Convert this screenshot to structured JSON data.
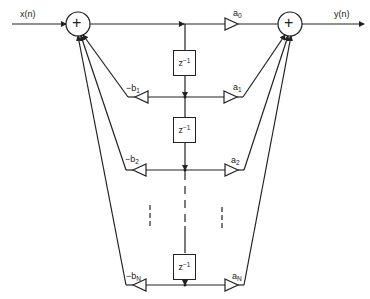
{
  "diagram": {
    "type": "IIR direct form II signal flow graph",
    "input_label": "x(n)",
    "output_label": "y(n)",
    "adders": [
      {
        "id": "left-adder",
        "symbol": "+"
      },
      {
        "id": "right-adder",
        "symbol": "+"
      }
    ],
    "delays": [
      {
        "label_base": "z",
        "label_exp": "−1"
      },
      {
        "label_base": "z",
        "label_exp": "−1"
      },
      {
        "label_base": "z",
        "label_exp": "−1"
      }
    ],
    "feedback_gains": [
      {
        "base": "−b",
        "sub": "1"
      },
      {
        "base": "−b",
        "sub": "2"
      },
      {
        "base": "−b",
        "sub": "N"
      }
    ],
    "feedforward_gains": [
      {
        "base": "a",
        "sub": "0"
      },
      {
        "base": "a",
        "sub": "1"
      },
      {
        "base": "a",
        "sub": "2"
      },
      {
        "base": "a",
        "sub": "N"
      }
    ],
    "ellipsis": "⋮",
    "colors": {
      "stroke": "#222222",
      "background": "#ffffff"
    }
  }
}
